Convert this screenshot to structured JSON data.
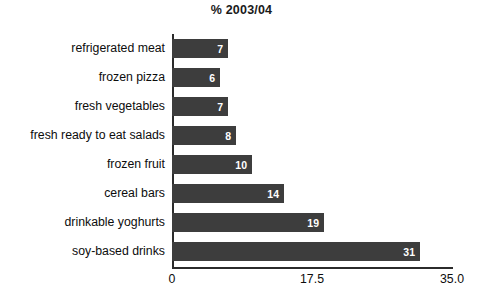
{
  "chart_data": {
    "type": "bar",
    "orientation": "horizontal",
    "title": "% 2003/04",
    "xlabel": "",
    "ylabel": "",
    "categories": [
      "refrigerated meat",
      "frozen pizza",
      "fresh vegetables",
      "fresh ready to eat salads",
      "frozen fruit",
      "cereal bars",
      "drinkable yoghurts",
      "soy-based drinks"
    ],
    "values": [
      7,
      6,
      7,
      8,
      10,
      14,
      19,
      31
    ],
    "value_labels": [
      "7",
      "6",
      "7",
      "8",
      "10",
      "14",
      "19",
      "31"
    ],
    "xlim": [
      0,
      35.0
    ],
    "xticks": [
      0,
      17.5,
      35.0
    ],
    "xtick_labels": [
      "0",
      "17.5",
      "35.0"
    ],
    "grid": false,
    "legend": null,
    "bar_color": "#3d3d3d",
    "value_label_color": "#ffffff",
    "axis_color": "#2b2b2b",
    "background_color": "#ffffff"
  }
}
